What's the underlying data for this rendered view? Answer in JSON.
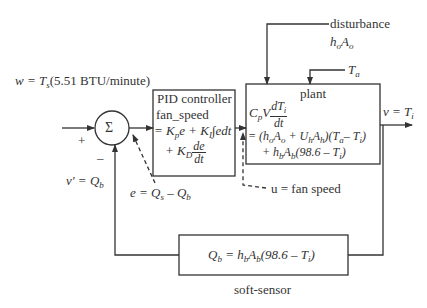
{
  "diagram": {
    "type": "feedback-control-block-diagram",
    "input": {
      "label": "w = T",
      "sub": "s",
      "suffix": "(5.51 BTU/minute)"
    },
    "summing_junction": {
      "symbol": "Σ",
      "plus_sign": "+",
      "minus_sign": "–"
    },
    "feedback_signal": {
      "lhs": "v′ = Q",
      "sub": "b"
    },
    "error_signal": {
      "lhs": "e = Q",
      "sub1": "s",
      "mid": " – Q",
      "sub2": "b"
    },
    "pid_controller": {
      "title": "PID controller",
      "line1": "fan_speed",
      "line2_a": "= K",
      "line2_sub_p": "p",
      "line2_b": "e + K",
      "line2_sub_i": "I",
      "line2_c": "∫edt",
      "line3_a": "+ K",
      "line3_sub_d": "D",
      "line3_num": "de",
      "line3_den": "dt"
    },
    "control_signal": {
      "label": "u = fan speed"
    },
    "disturbance": {
      "title": "disturbance",
      "expr_a": "h",
      "expr_sub1": "o",
      "expr_b": "A",
      "expr_sub2": "o"
    },
    "ambient": {
      "label": "T",
      "sub": "a"
    },
    "plant": {
      "title": "plant",
      "lhs_a": "C",
      "lhs_sub": "p",
      "lhs_b": "V",
      "lhs_num": "dT",
      "lhs_num_sub": "i",
      "lhs_den": "dt",
      "rhs1": "= (h",
      "rhs1_s1": "o",
      "rhs1_b": "A",
      "rhs1_s2": "o",
      "rhs1_c": " + U",
      "rhs1_s3": "h",
      "rhs1_d": "A",
      "rhs1_s4": "h",
      "rhs1_e": ")(T",
      "rhs1_s5": "a",
      "rhs1_f": "– T",
      "rhs1_s6": "i",
      "rhs1_g": ")",
      "rhs2_a": "+ h",
      "rhs2_s1": "b",
      "rhs2_b": "A",
      "rhs2_s2": "b",
      "rhs2_c": "(98.6 – T",
      "rhs2_s3": "i",
      "rhs2_d": ")"
    },
    "output": {
      "label": "v = T",
      "sub": "i"
    },
    "soft_sensor": {
      "caption": "soft-sensor",
      "a": "Q",
      "s1": "b",
      "b": " = h",
      "s2": "b",
      "c": "A",
      "s3": "b",
      "d": "(98.6 – T",
      "s4": "i",
      "e": ")"
    },
    "line_color": "#333333"
  }
}
